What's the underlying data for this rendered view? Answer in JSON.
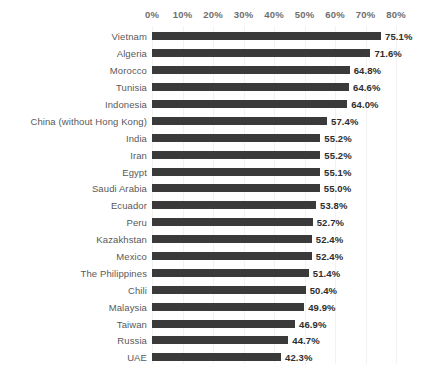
{
  "chart_data": {
    "type": "bar",
    "orientation": "horizontal",
    "title": "",
    "subtitle": "",
    "xlabel": "",
    "ylabel": "",
    "xlim": [
      0,
      80
    ],
    "xtick_labels": [
      "0%",
      "10%",
      "20%",
      "30%",
      "40%",
      "50%",
      "60%",
      "70%",
      "80%"
    ],
    "xticks": [
      0,
      10,
      20,
      30,
      40,
      50,
      60,
      70,
      80
    ],
    "grid": true,
    "legend": false,
    "value_suffix": "%",
    "categories": [
      "Vietnam",
      "Algeria",
      "Morocco",
      "Tunisia",
      "Indonesia",
      "China (without Hong Kong)",
      "India",
      "Iran",
      "Egypt",
      "Saudi Arabia",
      "Ecuador",
      "Peru",
      "Kazakhstan",
      "Mexico",
      "The Philippines",
      "Chili",
      "Malaysia",
      "Taiwan",
      "Russia",
      "UAE"
    ],
    "values": [
      75.1,
      71.6,
      64.8,
      64.6,
      64.0,
      57.4,
      55.2,
      55.2,
      55.1,
      55.0,
      53.8,
      52.7,
      52.4,
      52.4,
      51.4,
      50.4,
      49.9,
      46.9,
      44.7,
      42.3
    ],
    "value_labels": [
      "75.1%",
      "71.6%",
      "64.8%",
      "64.6%",
      "64.0%",
      "57.4%",
      "55.2%",
      "55.2%",
      "55.1%",
      "55.0%",
      "53.8%",
      "52.7%",
      "52.4%",
      "52.4%",
      "51.4%",
      "50.4%",
      "49.9%",
      "46.9%",
      "44.7%",
      "42.3%"
    ],
    "colors": {
      "bar": "#3a3a3a",
      "background": "#ffffff",
      "category_label": "#595959",
      "value_label": "#2e2e2e",
      "axis_label": "#6e6e6e",
      "gridline": "#f2f2f0"
    }
  }
}
